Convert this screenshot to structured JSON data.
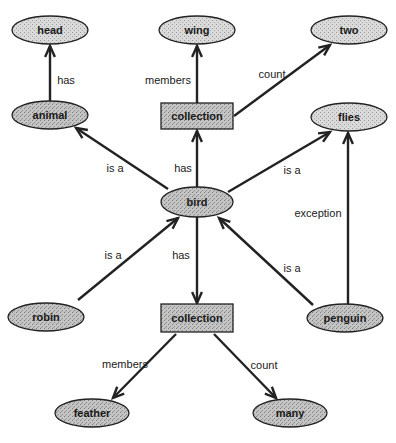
{
  "nodes": [
    {
      "id": "head",
      "label": "head",
      "shape": "ellipse",
      "x": 50,
      "y": 30,
      "w": 76,
      "h": 28,
      "tone": "light"
    },
    {
      "id": "wing",
      "label": "wing",
      "shape": "ellipse",
      "x": 197,
      "y": 30,
      "w": 76,
      "h": 28,
      "tone": "light"
    },
    {
      "id": "two",
      "label": "two",
      "shape": "ellipse",
      "x": 349,
      "y": 30,
      "w": 76,
      "h": 28,
      "tone": "light"
    },
    {
      "id": "animal",
      "label": "animal",
      "shape": "ellipse",
      "x": 50,
      "y": 115,
      "w": 76,
      "h": 28,
      "tone": "dark"
    },
    {
      "id": "collection1",
      "label": "collection",
      "shape": "box",
      "x": 197,
      "y": 116,
      "w": 72,
      "h": 26,
      "tone": "dark"
    },
    {
      "id": "flies",
      "label": "flies",
      "shape": "ellipse",
      "x": 349,
      "y": 117,
      "w": 76,
      "h": 28,
      "tone": "light"
    },
    {
      "id": "bird",
      "label": "bird",
      "shape": "ellipse",
      "x": 197,
      "y": 202,
      "w": 72,
      "h": 30,
      "tone": "dark"
    },
    {
      "id": "robin",
      "label": "robin",
      "shape": "ellipse",
      "x": 46,
      "y": 317,
      "w": 76,
      "h": 28,
      "tone": "dark"
    },
    {
      "id": "collection2",
      "label": "collection",
      "shape": "box",
      "x": 197,
      "y": 318,
      "w": 72,
      "h": 28,
      "tone": "dark"
    },
    {
      "id": "penguin",
      "label": "penguin",
      "shape": "ellipse",
      "x": 345,
      "y": 318,
      "w": 76,
      "h": 28,
      "tone": "dark"
    },
    {
      "id": "feather",
      "label": "feather",
      "shape": "ellipse",
      "x": 92,
      "y": 413,
      "w": 74,
      "h": 28,
      "tone": "dark"
    },
    {
      "id": "many",
      "label": "many",
      "shape": "ellipse",
      "x": 290,
      "y": 413,
      "w": 74,
      "h": 28,
      "tone": "dark"
    }
  ],
  "edges": [
    {
      "from": "animal",
      "to": "head",
      "label": "has",
      "x1": 50,
      "y1": 101,
      "x2": 50,
      "y2": 46,
      "lx": 66,
      "ly": 80
    },
    {
      "from": "collection1",
      "to": "wing",
      "label": "members",
      "x1": 197,
      "y1": 103,
      "x2": 197,
      "y2": 46,
      "lx": 168,
      "ly": 80
    },
    {
      "from": "collection1",
      "to": "two",
      "label": "count",
      "x1": 234,
      "y1": 116,
      "x2": 330,
      "y2": 45,
      "lx": 272,
      "ly": 74
    },
    {
      "from": "bird",
      "to": "animal",
      "label": "is a",
      "x1": 168,
      "y1": 189,
      "x2": 76,
      "y2": 128,
      "lx": 115,
      "ly": 168
    },
    {
      "from": "bird",
      "to": "collection1",
      "label": "has",
      "x1": 197,
      "y1": 187,
      "x2": 197,
      "y2": 131,
      "lx": 183,
      "ly": 168
    },
    {
      "from": "bird",
      "to": "flies",
      "label": "is a",
      "x1": 228,
      "y1": 192,
      "x2": 330,
      "y2": 132,
      "lx": 292,
      "ly": 170
    },
    {
      "from": "robin",
      "to": "bird",
      "label": "is a",
      "x1": 78,
      "y1": 300,
      "x2": 178,
      "y2": 218,
      "lx": 113,
      "ly": 255
    },
    {
      "from": "bird",
      "to": "collection2",
      "label": "has",
      "x1": 197,
      "y1": 217,
      "x2": 197,
      "y2": 303,
      "lx": 181,
      "ly": 255
    },
    {
      "from": "penguin",
      "to": "bird",
      "label": "is a",
      "x1": 313,
      "y1": 305,
      "x2": 219,
      "y2": 218,
      "lx": 292,
      "ly": 268
    },
    {
      "from": "penguin",
      "to": "flies",
      "label": "exception",
      "x1": 348,
      "y1": 304,
      "x2": 348,
      "y2": 133,
      "lx": 318,
      "ly": 213
    },
    {
      "from": "collection2",
      "to": "feather",
      "label": "members",
      "x1": 176,
      "y1": 334,
      "x2": 113,
      "y2": 398,
      "lx": 125,
      "ly": 364
    },
    {
      "from": "collection2",
      "to": "many",
      "label": "count",
      "x1": 214,
      "y1": 334,
      "x2": 276,
      "y2": 398,
      "lx": 264,
      "ly": 365
    }
  ],
  "colors": {
    "stroke": "#222222",
    "fill_light": "#d4d4d4",
    "fill_dark": "#bdbdbd",
    "background": "#ffffff"
  }
}
